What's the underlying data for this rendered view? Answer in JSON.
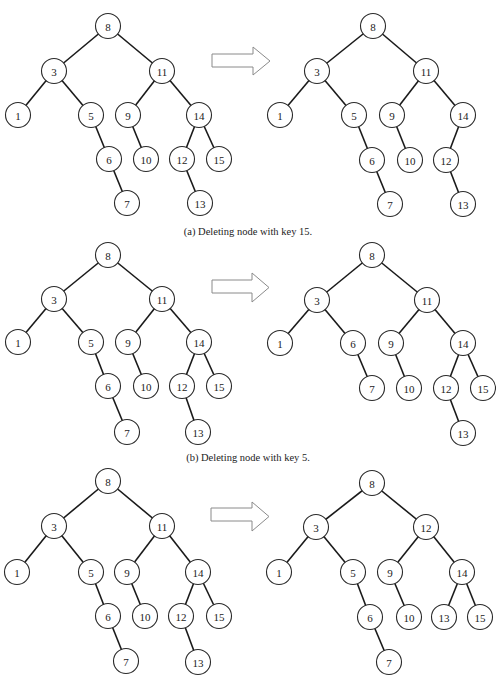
{
  "node_radius": 12.5,
  "panels": [
    {
      "id": "a",
      "caption": "(a) Deleting node with key 15.",
      "caption_y": 226,
      "arrow": {
        "x1": 212,
        "x2": 270,
        "y_top": 47,
        "y_bot": 75,
        "shaft_top": 54,
        "shaft_bot": 67,
        "head_x": 253
      },
      "before": {
        "nodes": [
          {
            "key": "8",
            "x": 108,
            "y": 26
          },
          {
            "key": "3",
            "x": 54,
            "y": 71
          },
          {
            "key": "11",
            "x": 162,
            "y": 71
          },
          {
            "key": "1",
            "x": 18,
            "y": 115
          },
          {
            "key": "5",
            "x": 91,
            "y": 115
          },
          {
            "key": "9",
            "x": 128,
            "y": 115
          },
          {
            "key": "14",
            "x": 199,
            "y": 115
          },
          {
            "key": "6",
            "x": 109,
            "y": 159
          },
          {
            "key": "10",
            "x": 146,
            "y": 159
          },
          {
            "key": "12",
            "x": 182,
            "y": 159
          },
          {
            "key": "15",
            "x": 219,
            "y": 159
          },
          {
            "key": "7",
            "x": 127,
            "y": 203
          },
          {
            "key": "13",
            "x": 200,
            "y": 203
          }
        ],
        "edges": [
          [
            "8",
            "3"
          ],
          [
            "8",
            "11"
          ],
          [
            "3",
            "1"
          ],
          [
            "3",
            "5"
          ],
          [
            "5",
            "6"
          ],
          [
            "6",
            "7"
          ],
          [
            "11",
            "9"
          ],
          [
            "11",
            "14"
          ],
          [
            "9",
            "10"
          ],
          [
            "14",
            "12"
          ],
          [
            "14",
            "15"
          ],
          [
            "12",
            "13"
          ]
        ]
      },
      "after": {
        "nodes": [
          {
            "key": "8",
            "x": 373,
            "y": 26
          },
          {
            "key": "3",
            "x": 317,
            "y": 71
          },
          {
            "key": "11",
            "x": 426,
            "y": 71
          },
          {
            "key": "1",
            "x": 280,
            "y": 115
          },
          {
            "key": "5",
            "x": 354,
            "y": 115
          },
          {
            "key": "9",
            "x": 392,
            "y": 115
          },
          {
            "key": "14",
            "x": 463,
            "y": 115
          },
          {
            "key": "6",
            "x": 372,
            "y": 160
          },
          {
            "key": "10",
            "x": 410,
            "y": 160
          },
          {
            "key": "12",
            "x": 446,
            "y": 160
          },
          {
            "key": "7",
            "x": 390,
            "y": 204
          },
          {
            "key": "13",
            "x": 463,
            "y": 204
          }
        ],
        "edges": [
          [
            "8",
            "3"
          ],
          [
            "8",
            "11"
          ],
          [
            "3",
            "1"
          ],
          [
            "3",
            "5"
          ],
          [
            "5",
            "6"
          ],
          [
            "6",
            "7"
          ],
          [
            "11",
            "9"
          ],
          [
            "11",
            "14"
          ],
          [
            "9",
            "10"
          ],
          [
            "14",
            "12"
          ],
          [
            "12",
            "13"
          ]
        ]
      }
    },
    {
      "id": "b",
      "caption": "(b) Deleting node with key 5.",
      "caption_y": 452,
      "arrow": {
        "x1": 212,
        "x2": 269,
        "y_top": 273,
        "y_bot": 302,
        "shaft_top": 280,
        "shaft_bot": 293,
        "head_x": 252
      },
      "before": {
        "nodes": [
          {
            "key": "8",
            "x": 108,
            "y": 255
          },
          {
            "key": "3",
            "x": 54,
            "y": 299
          },
          {
            "key": "11",
            "x": 162,
            "y": 299
          },
          {
            "key": "1",
            "x": 18,
            "y": 342
          },
          {
            "key": "5",
            "x": 91,
            "y": 342
          },
          {
            "key": "9",
            "x": 128,
            "y": 342
          },
          {
            "key": "14",
            "x": 199,
            "y": 342
          },
          {
            "key": "6",
            "x": 108,
            "y": 386
          },
          {
            "key": "10",
            "x": 146,
            "y": 386
          },
          {
            "key": "12",
            "x": 182,
            "y": 386
          },
          {
            "key": "15",
            "x": 219,
            "y": 386
          },
          {
            "key": "7",
            "x": 127,
            "y": 432
          },
          {
            "key": "13",
            "x": 198,
            "y": 432
          }
        ],
        "edges": [
          [
            "8",
            "3"
          ],
          [
            "8",
            "11"
          ],
          [
            "3",
            "1"
          ],
          [
            "3",
            "5"
          ],
          [
            "5",
            "6"
          ],
          [
            "6",
            "7"
          ],
          [
            "11",
            "9"
          ],
          [
            "11",
            "14"
          ],
          [
            "9",
            "10"
          ],
          [
            "14",
            "12"
          ],
          [
            "14",
            "15"
          ],
          [
            "12",
            "13"
          ]
        ]
      },
      "after": {
        "nodes": [
          {
            "key": "8",
            "x": 372,
            "y": 255
          },
          {
            "key": "3",
            "x": 317,
            "y": 300
          },
          {
            "key": "11",
            "x": 427,
            "y": 300
          },
          {
            "key": "1",
            "x": 280,
            "y": 343
          },
          {
            "key": "6",
            "x": 353,
            "y": 343
          },
          {
            "key": "9",
            "x": 391,
            "y": 343
          },
          {
            "key": "14",
            "x": 463,
            "y": 343
          },
          {
            "key": "7",
            "x": 372,
            "y": 388
          },
          {
            "key": "10",
            "x": 409,
            "y": 388
          },
          {
            "key": "12",
            "x": 446,
            "y": 388
          },
          {
            "key": "15",
            "x": 483,
            "y": 388
          },
          {
            "key": "13",
            "x": 463,
            "y": 433
          }
        ],
        "edges": [
          [
            "8",
            "3"
          ],
          [
            "8",
            "11"
          ],
          [
            "3",
            "1"
          ],
          [
            "3",
            "6"
          ],
          [
            "6",
            "7"
          ],
          [
            "11",
            "9"
          ],
          [
            "11",
            "14"
          ],
          [
            "9",
            "10"
          ],
          [
            "14",
            "12"
          ],
          [
            "14",
            "15"
          ],
          [
            "12",
            "13"
          ]
        ]
      }
    },
    {
      "id": "c",
      "caption": "",
      "caption_y": 0,
      "arrow": {
        "x1": 211,
        "x2": 269,
        "y_top": 502,
        "y_bot": 531,
        "shaft_top": 508,
        "shaft_bot": 521,
        "head_x": 252
      },
      "before": {
        "nodes": [
          {
            "key": "8",
            "x": 108,
            "y": 481
          },
          {
            "key": "3",
            "x": 54,
            "y": 526
          },
          {
            "key": "11",
            "x": 162,
            "y": 526
          },
          {
            "key": "1",
            "x": 17,
            "y": 572
          },
          {
            "key": "5",
            "x": 91,
            "y": 572
          },
          {
            "key": "9",
            "x": 127,
            "y": 572
          },
          {
            "key": "14",
            "x": 198,
            "y": 572
          },
          {
            "key": "6",
            "x": 108,
            "y": 616
          },
          {
            "key": "10",
            "x": 145,
            "y": 616
          },
          {
            "key": "12",
            "x": 181,
            "y": 616
          },
          {
            "key": "15",
            "x": 219,
            "y": 616
          },
          {
            "key": "7",
            "x": 126,
            "y": 661
          },
          {
            "key": "13",
            "x": 198,
            "y": 662
          }
        ],
        "edges": [
          [
            "8",
            "3"
          ],
          [
            "8",
            "11"
          ],
          [
            "3",
            "1"
          ],
          [
            "3",
            "5"
          ],
          [
            "5",
            "6"
          ],
          [
            "6",
            "7"
          ],
          [
            "11",
            "9"
          ],
          [
            "11",
            "14"
          ],
          [
            "9",
            "10"
          ],
          [
            "14",
            "12"
          ],
          [
            "14",
            "15"
          ],
          [
            "12",
            "13"
          ]
        ]
      },
      "after": {
        "nodes": [
          {
            "key": "8",
            "x": 372,
            "y": 483
          },
          {
            "key": "3",
            "x": 316,
            "y": 527
          },
          {
            "key": "12",
            "x": 426,
            "y": 527
          },
          {
            "key": "1",
            "x": 279,
            "y": 572
          },
          {
            "key": "5",
            "x": 353,
            "y": 572
          },
          {
            "key": "9",
            "x": 390,
            "y": 572
          },
          {
            "key": "14",
            "x": 462,
            "y": 572
          },
          {
            "key": "6",
            "x": 370,
            "y": 617
          },
          {
            "key": "10",
            "x": 409,
            "y": 617
          },
          {
            "key": "13",
            "x": 444,
            "y": 617
          },
          {
            "key": "15",
            "x": 480,
            "y": 617
          },
          {
            "key": "7",
            "x": 389,
            "y": 662
          }
        ],
        "edges": [
          [
            "8",
            "3"
          ],
          [
            "8",
            "12"
          ],
          [
            "3",
            "1"
          ],
          [
            "3",
            "5"
          ],
          [
            "5",
            "6"
          ],
          [
            "6",
            "7"
          ],
          [
            "12",
            "9"
          ],
          [
            "12",
            "14"
          ],
          [
            "9",
            "10"
          ],
          [
            "14",
            "13"
          ],
          [
            "14",
            "15"
          ]
        ]
      }
    }
  ]
}
